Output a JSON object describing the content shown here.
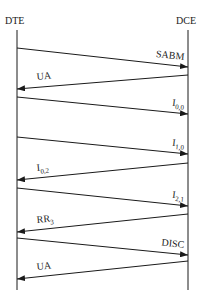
{
  "diagram": {
    "type": "sequence",
    "participants": [
      {
        "id": "dte",
        "label": "DTE",
        "x": 17
      },
      {
        "id": "dce",
        "label": "DCE",
        "x": 188
      }
    ],
    "lifeline": {
      "top": 30,
      "bottom": 290
    },
    "messages": [
      {
        "from": "DTE",
        "to": "DCE",
        "label": "SABM",
        "sub": "",
        "y1": 48,
        "y2": 67
      },
      {
        "from": "DCE",
        "to": "DTE",
        "label": "UA",
        "sub": "",
        "y1": 75,
        "y2": 89
      },
      {
        "from": "DTE",
        "to": "DCE",
        "label": "I",
        "sub": "0,0",
        "y1": 97,
        "y2": 114
      },
      {
        "from": "DTE",
        "to": "DCE",
        "label": "I",
        "sub": "1,0",
        "y1": 137,
        "y2": 154
      },
      {
        "from": "DCE",
        "to": "DTE",
        "label": "I",
        "sub": "0,2",
        "y1": 163,
        "y2": 180
      },
      {
        "from": "DTE",
        "to": "DCE",
        "label": "I",
        "sub": "2,1",
        "y1": 188,
        "y2": 206
      },
      {
        "from": "DCE",
        "to": "DTE",
        "label": "RR",
        "sub": "3",
        "y1": 214,
        "y2": 232
      },
      {
        "from": "DTE",
        "to": "DCE",
        "label": "DISC",
        "sub": "",
        "y1": 238,
        "y2": 255
      },
      {
        "from": "DCE",
        "to": "DTE",
        "label": "UA",
        "sub": "",
        "y1": 261,
        "y2": 279
      }
    ]
  },
  "colors": {
    "line": "#1a1a1a",
    "background": "#ffffff"
  }
}
